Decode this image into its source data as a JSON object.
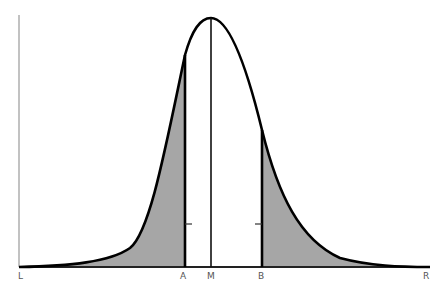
{
  "diagram": {
    "type": "skewed-distribution-curve",
    "colors": {
      "curve": "#000000",
      "fill": "#a6a6a6",
      "axis": "#999999",
      "baseline": "#222222",
      "label": "#555555"
    },
    "axis_labels": {
      "left": "L",
      "right": "R"
    },
    "markers": [
      {
        "id": "A",
        "label": "A",
        "x": 185,
        "line_top": 55,
        "shaded_side": "left",
        "tick": "right"
      },
      {
        "id": "M",
        "label": "M",
        "x": 211,
        "line_top": 18,
        "shaded_side": "none",
        "tick": "none"
      },
      {
        "id": "B",
        "label": "B",
        "x": 262,
        "line_top": 130,
        "shaded_side": "right",
        "tick": "left"
      }
    ],
    "regions": [
      {
        "name": "left-tail",
        "from": "L",
        "to": "A",
        "shaded": true
      },
      {
        "name": "right-tail",
        "from": "B",
        "to": "R",
        "shaded": true
      }
    ]
  }
}
